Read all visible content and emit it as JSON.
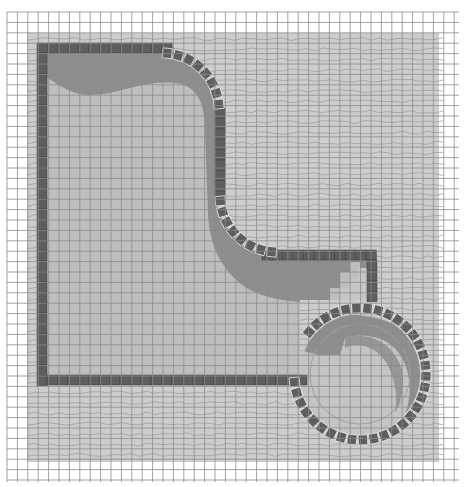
{
  "diagram": {
    "title": "Pool and spa site plan",
    "type": "pool-plan-diagram",
    "canvas": {
      "width": 467,
      "height": 487
    },
    "grid": {
      "x0": 7,
      "y0": 12,
      "x1": 459,
      "y1": 482,
      "spacing": 10.4,
      "color": "#8c8c8c"
    },
    "pavement": {
      "x": 27,
      "y": 33,
      "width": 412,
      "height": 429,
      "color": "#cdcdcd",
      "texture_color": "#9a9a9a"
    },
    "pool": {
      "label": "Main pool",
      "water_color": "#bebebe",
      "shadow_color": "#8e8e8e",
      "coping_color": "#5e5e5e",
      "coping_joint_color": "#ececec",
      "coping_width": 10
    },
    "spa": {
      "label": "Spa",
      "center": [
        360,
        374
      ],
      "radius": 65,
      "water_color": "#c4c4c4",
      "shadow_color": "#8e8e8e",
      "inner_ring_color": "#a0a0a0"
    },
    "colors": {
      "background": "#ffffff",
      "grid": "#8c8c8c",
      "pavement": "#cdcdcd",
      "water": "#bebebe",
      "shadow": "#8e8e8e",
      "coping": "#5e5e5e"
    }
  }
}
